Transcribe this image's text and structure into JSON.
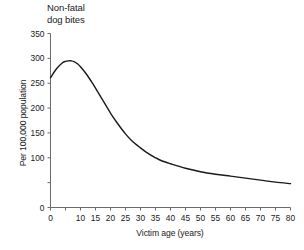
{
  "chart_data": {
    "type": "line",
    "title": "Non-fatal\ndog bites",
    "xlabel": "Victim age (years)",
    "ylabel": "Per 100,000 population",
    "xlim": [
      0,
      80
    ],
    "ylim": [
      0,
      350
    ],
    "grid": false,
    "legend": "none",
    "line_color": "#1a1a1a",
    "axis_color": "#6b6b6b",
    "x_ticks": [
      0,
      5,
      10,
      15,
      20,
      25,
      30,
      35,
      40,
      45,
      50,
      55,
      60,
      65,
      70,
      75,
      80
    ],
    "x_tick_labels": [
      "0",
      "",
      "10",
      "15",
      "20",
      "25",
      "30",
      "35",
      "40",
      "45",
      "50",
      "55",
      "60",
      "65",
      "70",
      "75",
      "80"
    ],
    "y_ticks": [
      0,
      50,
      100,
      150,
      200,
      250,
      300,
      350
    ],
    "y_tick_labels": [
      "0",
      "",
      "100",
      "150",
      "200",
      "250",
      "300",
      "350"
    ],
    "series": [
      {
        "name": "Non-fatal dog bites",
        "x": [
          0,
          2,
          4,
          5,
          6,
          7,
          8,
          9,
          10,
          12,
          14,
          15,
          17,
          20,
          22,
          25,
          27,
          30,
          32,
          35,
          37,
          40,
          45,
          50,
          55,
          60,
          65,
          70,
          75,
          80
        ],
        "values": [
          261,
          279,
          291,
          294,
          295,
          295,
          293,
          289,
          283,
          268,
          250,
          240,
          220,
          190,
          172,
          148,
          135,
          120,
          111,
          100,
          94,
          88,
          79,
          72,
          67,
          63,
          59,
          55,
          51,
          48
        ]
      }
    ]
  }
}
